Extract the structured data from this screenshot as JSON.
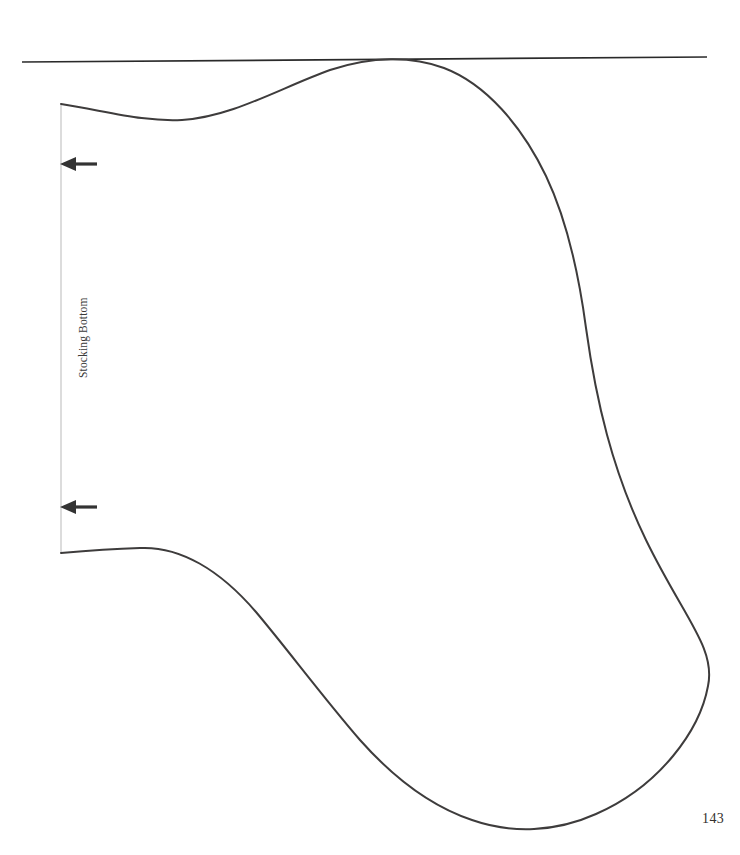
{
  "document": {
    "type": "sewing-pattern-template",
    "page_number": "143",
    "background_color": "#ffffff"
  },
  "labels": {
    "stocking_bottom": "Stocking Bottom"
  },
  "colors": {
    "outline": "#3e3c3c",
    "fold_line": "#d9d9d9",
    "top_rule": "#2a2a2a",
    "arrow": "#333333",
    "text": "#33302e"
  },
  "graphics": {
    "top_rule": {
      "name": "top-horizontal-rule",
      "x1": 22,
      "y1": 62,
      "x2": 707,
      "y2": 57,
      "stroke_width": 1.6
    },
    "fold_line": {
      "name": "stocking-bottom-fold-line",
      "x1": 61,
      "y1": 104,
      "x2": 61,
      "y2": 553,
      "stroke_width": 1.6
    },
    "arrows": [
      {
        "name": "arrow-marker-top",
        "tail_x": 97,
        "head_x": 61,
        "y": 164
      },
      {
        "name": "arrow-marker-bottom",
        "tail_x": 97,
        "head_x": 61,
        "y": 507
      }
    ],
    "stocking_outline": {
      "name": "stocking-outline-path",
      "stroke_width": 2.0,
      "path": "M 61,104 C 110,112 145,122 182,120 C 232,117 280,88 330,70 C 372,56 412,56 444,68 C 486,84 522,126 546,176 C 566,218 578,268 586,328 C 596,400 612,470 646,540 C 684,618 716,648 708,686 C 700,730 660,786 596,814 C 556,832 512,834 472,820 C 430,806 392,776 360,740 C 322,696 288,650 256,612 C 220,570 180,546 140,548 C 110,549 84,551 61,553"
    },
    "page_number_position": {
      "x": 708,
      "y": 818
    }
  }
}
